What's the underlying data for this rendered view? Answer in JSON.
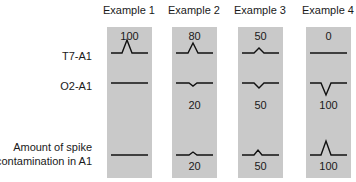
{
  "columns": [
    {
      "header": "Example 1",
      "t7_value": "100",
      "o2_value": "",
      "contamination_value": ""
    },
    {
      "header": "Example 2",
      "t7_value": "80",
      "o2_value": "20",
      "contamination_value": "20"
    },
    {
      "header": "Example 3",
      "t7_value": "50",
      "o2_value": "50",
      "contamination_value": "50"
    },
    {
      "header": "Example 4",
      "t7_value": "0",
      "o2_value": "100",
      "contamination_value": "100"
    }
  ],
  "row_labels": {
    "t7": "T7-A1",
    "o2": "O2-A1",
    "contamination_line1": "Amount of spike",
    "contamination_line2": "contamination in A1"
  },
  "colors": {
    "panel_bg": "#c9c9c9",
    "trace": "#111111"
  }
}
